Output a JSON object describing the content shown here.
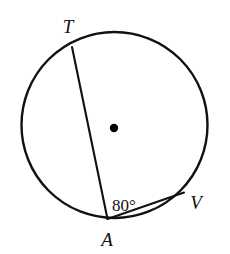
{
  "figure": {
    "background_color": "#ffffff",
    "stroke_color": "#111111",
    "center_dot_color": "#000000"
  },
  "circle": {
    "name": "circle-outline",
    "center_x": 114.5,
    "center_y": 125,
    "radius": 93,
    "stroke_width": 2.4,
    "fill": "none"
  },
  "center_point": {
    "name": "center-dot",
    "x": 114,
    "y": 128,
    "radius": 4.2
  },
  "chords": [
    {
      "name": "chord-TA",
      "from": "T",
      "to": "A",
      "x1": 72,
      "y1": 47,
      "x2": 107.5,
      "y2": 219,
      "stroke_width": 2.1
    },
    {
      "name": "chord-AV",
      "from": "A",
      "to": "V",
      "x1": 107.5,
      "y1": 219,
      "x2": 184,
      "y2": 192.5,
      "stroke_width": 2.1
    }
  ],
  "points": [
    {
      "id": "T",
      "label": "T",
      "label_x": 68,
      "label_y": 33,
      "font_size": 19
    },
    {
      "id": "A",
      "label": "A",
      "label_x": 107,
      "label_y": 246,
      "font_size": 19
    },
    {
      "id": "V",
      "label": "V",
      "label_x": 196,
      "label_y": 209,
      "font_size": 19
    }
  ],
  "angles": [
    {
      "name": "angle-TAV",
      "vertex": "A",
      "value": 80,
      "unit": "degrees",
      "label": "80°",
      "label_x": 112,
      "label_y": 211,
      "font_size": 17
    }
  ]
}
